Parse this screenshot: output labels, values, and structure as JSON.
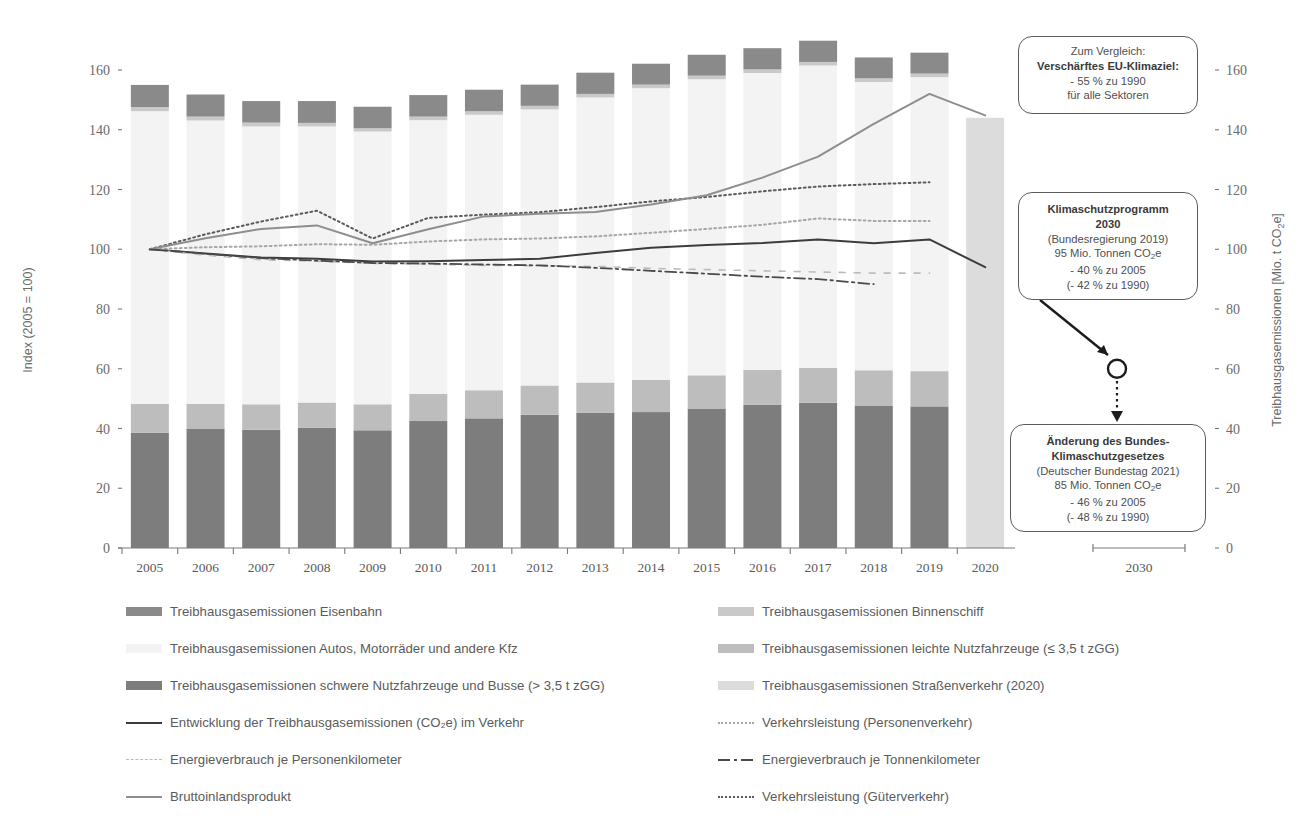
{
  "axes": {
    "left_title": "Index (2005 = 100)",
    "right_title": "Treibhausgasemissionen [Mio. t CO2e]",
    "left_ticks": [
      "0",
      "20",
      "40",
      "60",
      "80",
      "100",
      "120",
      "140",
      "160"
    ],
    "right_ticks": [
      "0",
      "20",
      "40",
      "60",
      "80",
      "100",
      "120",
      "140",
      "160"
    ],
    "x_labels": [
      "2005",
      "2006",
      "2007",
      "2008",
      "2009",
      "2010",
      "2011",
      "2012",
      "2013",
      "2014",
      "2015",
      "2016",
      "2017",
      "2018",
      "2019",
      "2020"
    ],
    "x_label_future": "2030"
  },
  "callouts": {
    "eu": {
      "l1": "Zum Vergleich:",
      "l2": "Verschärftes EU-Klimaziel:",
      "l3": "- 55 % zu 1990",
      "l4": "für alle Sektoren"
    },
    "ksp": {
      "l1": "Klimaschutzprogramm",
      "l2": "2030",
      "l3": "(Bundesregierung 2019)",
      "l4": "95 Mio. Tonnen CO2e",
      "l5": "- 40 % zu 2005",
      "l6": "(- 42 % zu 1990)"
    },
    "bksg": {
      "l1": "Änderung des Bundes-",
      "l2": "Klimaschutzgesetzes",
      "l3": "(Deutscher Bundestag 2021)",
      "l4": "85 Mio. Tonnen CO2e",
      "l5": "- 46 % zu 2005",
      "l6": "(- 48 % zu 1990)"
    }
  },
  "legend": {
    "col1": [
      {
        "label": "Treibhausgasemissionen Eisenbahn",
        "marker": "swatch",
        "color": "#8a8a8a"
      },
      {
        "label": "Treibhausgasemissionen Autos, Motorräder und andere Kfz",
        "marker": "swatch",
        "color": "#f3f3f3"
      },
      {
        "label": "Treibhausgasemissionen schwere Nutzfahrzeuge und Busse (> 3,5 t zGG)",
        "marker": "swatch",
        "color": "#7d7d7d"
      },
      {
        "label": "Entwicklung der Treibhausgasemissionen (CO2e) im Verkehr",
        "marker": "solid",
        "color": "#3c3c3c"
      },
      {
        "label": "Energieverbrauch je Personenkilometer",
        "marker": "dashed-light",
        "color": "#b9b9b9"
      },
      {
        "label": "Bruttoinlandsprodukt",
        "marker": "solid",
        "color": "#8e8e8e"
      }
    ],
    "col2": [
      {
        "label": "Treibhausgasemissionen Binnenschiff",
        "marker": "swatch",
        "color": "#c9c9c9"
      },
      {
        "label": "Treibhausgasemissionen leichte Nutzfahrzeuge (≤ 3,5 t zGG)",
        "marker": "swatch",
        "color": "#bdbdbd"
      },
      {
        "label": "Treibhausgasemissionen Straßenverkehr (2020)",
        "marker": "swatch",
        "color": "#dcdcdc"
      },
      {
        "label": "Verkehrsleistung (Personenverkehr)",
        "marker": "dotted",
        "color": "#a6a6a6"
      },
      {
        "label": "Energieverbrauch je Tonnenkilometer",
        "marker": "dashdot",
        "color": "#4a4a4a"
      },
      {
        "label": "Verkehrsleistung (Güterverkehr)",
        "marker": "dotted",
        "color": "#5a5a5a"
      }
    ]
  },
  "chart_data": {
    "type": "bar",
    "title": "",
    "xlabel": "",
    "ylabel": "Index (2005 = 100)",
    "ylim": [
      0,
      170
    ],
    "grid": false,
    "legend_position": "bottom",
    "categories": [
      "2005",
      "2006",
      "2007",
      "2008",
      "2009",
      "2010",
      "2011",
      "2012",
      "2013",
      "2014",
      "2015",
      "2016",
      "2017",
      "2018",
      "2019",
      "2020"
    ],
    "stacked_series": [
      {
        "name": "Treibhausgasemissionen schwere Nutzfahrzeuge und Busse (> 3,5 t zGG)",
        "color": "#7d7d7d",
        "values": [
          38.6,
          40.0,
          39.6,
          40.3,
          39.4,
          42.5,
          43.4,
          44.6,
          45.3,
          45.5,
          46.7,
          48.0,
          48.6,
          47.7,
          47.4,
          null
        ]
      },
      {
        "name": "Treibhausgasemissionen leichte Nutzfahrzeuge (≤ 3,5 t zGG)",
        "color": "#bdbdbd",
        "values": [
          9.6,
          8.2,
          8.5,
          8.4,
          8.7,
          9.1,
          9.4,
          9.8,
          10.1,
          10.8,
          11.1,
          11.6,
          11.7,
          11.8,
          11.8,
          null
        ]
      },
      {
        "name": "Treibhausgasemissionen Autos, Motorräder und andere Kfz",
        "color": "#f3f3f3",
        "values": [
          98.0,
          94.9,
          93.0,
          92.4,
          91.3,
          91.6,
          92.2,
          92.4,
          95.4,
          97.6,
          99.1,
          99.4,
          101.2,
          96.5,
          98.4,
          null
        ]
      },
      {
        "name": "Treibhausgasemissionen Binnenschiff",
        "color": "#c9c9c9",
        "values": [
          1.4,
          1.3,
          1.3,
          1.2,
          1.1,
          1.2,
          1.2,
          1.2,
          1.2,
          1.2,
          1.2,
          1.2,
          1.2,
          1.2,
          1.2,
          null
        ]
      },
      {
        "name": "Treibhausgasemissionen Eisenbahn",
        "color": "#8a8a8a",
        "values": [
          7.4,
          7.4,
          7.2,
          7.3,
          7.2,
          7.2,
          7.2,
          7.1,
          7.1,
          7.0,
          7.0,
          7.1,
          7.1,
          7.0,
          7.0,
          null
        ]
      },
      {
        "name": "Treibhausgasemissionen Straßenverkehr (2020)",
        "color": "#dcdcdc",
        "values": [
          null,
          null,
          null,
          null,
          null,
          null,
          null,
          null,
          null,
          null,
          null,
          null,
          null,
          null,
          null,
          144.0
        ]
      }
    ],
    "bar_totals": [
      155.0,
      151.8,
      149.6,
      149.6,
      147.7,
      151.6,
      153.4,
      155.1,
      159.1,
      162.1,
      165.1,
      167.3,
      169.8,
      164.2,
      165.8,
      144.0
    ],
    "line_series": [
      {
        "name": "Entwicklung der Treibhausgasemissionen (CO2e) im Verkehr",
        "style": "solid",
        "color": "#3c3c3c",
        "width": 2.0,
        "values": [
          100,
          98.6,
          97.2,
          96.8,
          95.9,
          96.0,
          96.4,
          96.8,
          98.7,
          100.5,
          101.4,
          102.1,
          103.3,
          102.0,
          103.3,
          94.0
        ]
      },
      {
        "name": "Verkehrsleistung (Personenverkehr)",
        "style": "dotted",
        "color": "#a6a6a6",
        "width": 2.0,
        "values": [
          100,
          100.7,
          101.0,
          101.7,
          101.5,
          102.6,
          103.3,
          103.6,
          104.3,
          105.5,
          106.8,
          108.2,
          110.3,
          109.5,
          109.5,
          null
        ]
      },
      {
        "name": "Verkehrsleistung (Güterverkehr)",
        "style": "dotted",
        "color": "#5a5a5a",
        "width": 2.0,
        "values": [
          100,
          105.0,
          109.3,
          112.9,
          103.6,
          110.5,
          111.6,
          112.4,
          114.1,
          116.0,
          117.5,
          119.4,
          121.0,
          121.8,
          122.4,
          null
        ]
      },
      {
        "name": "Bruttoinlandsprodukt",
        "style": "solid",
        "color": "#8e8e8e",
        "width": 2.0,
        "values": [
          100,
          103.7,
          106.8,
          108.0,
          102.0,
          106.7,
          111.0,
          111.9,
          112.5,
          115.0,
          118.1,
          124.0,
          131.0,
          142.0,
          152.0,
          144.8
        ]
      },
      {
        "name": "Energieverbrauch je Personenkilometer",
        "style": "dashed-light",
        "color": "#bcbcbc",
        "width": 1.6,
        "values": [
          100,
          98.0,
          96.5,
          96.0,
          95.3,
          95.0,
          94.6,
          94.5,
          94.3,
          93.6,
          93.2,
          92.8,
          92.4,
          92.0,
          92.0,
          null
        ]
      },
      {
        "name": "Energieverbrauch je Tonnenkilometer",
        "style": "dashdot",
        "color": "#4a4a4a",
        "width": 1.8,
        "values": [
          100,
          98.5,
          97.0,
          96.2,
          95.4,
          95.2,
          94.9,
          94.6,
          93.8,
          92.8,
          91.8,
          90.8,
          90.0,
          88.3,
          null,
          null
        ]
      }
    ],
    "target_marker": {
      "name": "Klimaschutzprogramm 2030 Ziel",
      "x_label": "2030",
      "value_right_axis": 95,
      "index_value": 60
    },
    "annotations": [
      {
        "text": "Zum Vergleich: Verschärftes EU-Klimaziel: - 55 % zu 1990 für alle Sektoren"
      },
      {
        "text": "Klimaschutzprogramm 2030 (Bundesregierung 2019) 95 Mio. Tonnen CO2e - 40 % zu 2005 (- 42 % zu 1990)"
      },
      {
        "text": "Änderung des Bundes-Klimaschutzgesetzes (Deutscher Bundestag 2021) 85 Mio. Tonnen CO2e - 46 % zu 2005 (- 48 % zu 1990)"
      }
    ]
  }
}
